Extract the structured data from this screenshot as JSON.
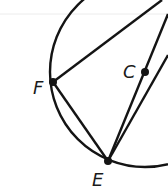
{
  "diagram": {
    "type": "circle-geometry",
    "circle": {
      "center_label": "C",
      "cx": 145,
      "cy": 72,
      "r": 95
    },
    "points": [
      {
        "label": "F",
        "x": 53,
        "y": 82,
        "label_x": 34,
        "label_y": 94
      },
      {
        "label": "C",
        "x": 145,
        "y": 72,
        "label_x": 124,
        "label_y": 78
      },
      {
        "label": "E",
        "x": 108,
        "y": 161,
        "label_x": 93,
        "label_y": 186
      }
    ],
    "segments": [
      {
        "name": "F-to-top-right",
        "from": "F",
        "to_xy": [
          162,
          0
        ]
      },
      {
        "name": "E-through-C",
        "from": "E",
        "to_xy": [
          168,
          14
        ]
      },
      {
        "name": "E-to-right",
        "from": "E",
        "to_xy": [
          168,
          55
        ]
      },
      {
        "name": "chord-FE",
        "from": "F",
        "to": "E"
      }
    ],
    "colors": {
      "ink": "#141414",
      "background": "#ffffff",
      "rule": "#ececec"
    }
  },
  "labels": {
    "F": "F",
    "C": "C",
    "E": "E"
  }
}
